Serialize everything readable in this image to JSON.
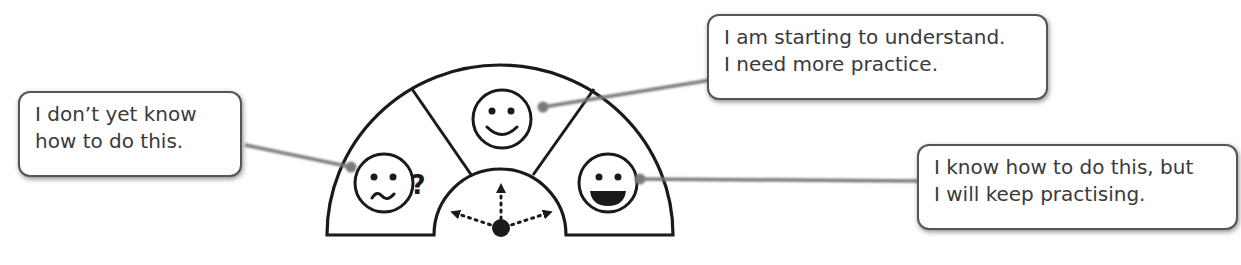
{
  "diagram": {
    "colors": {
      "stroke": "#1a1a1a",
      "connector": "#7a7a7a",
      "bubble_border": "#555555",
      "text": "#3a3a3a",
      "background": "#ffffff"
    },
    "segments": [
      {
        "id": "not-yet",
        "face": "confused-face-icon",
        "extra_symbol": "?",
        "callout": {
          "line1": "I don’t yet know",
          "line2": "how to do this."
        }
      },
      {
        "id": "starting",
        "face": "smiling-face-icon",
        "callout": {
          "line1": "I am starting to understand.",
          "line2": "I need more practice."
        }
      },
      {
        "id": "know-how",
        "face": "grinning-face-icon",
        "callout": {
          "line1": "I know how to do this, but",
          "line2": "I will keep practising."
        }
      }
    ],
    "dial": {
      "pointers": [
        "left",
        "up",
        "right"
      ]
    }
  }
}
